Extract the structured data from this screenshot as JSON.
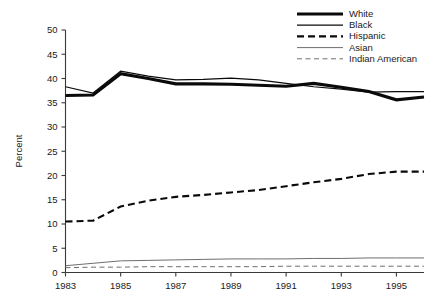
{
  "chart_data": {
    "type": "line",
    "title": "",
    "xlabel": "",
    "ylabel": "Percent",
    "xlim": [
      1983,
      1996
    ],
    "ylim": [
      0,
      50
    ],
    "grid": false,
    "legend_position": "top-right",
    "x": [
      1983,
      1984,
      1985,
      1986,
      1987,
      1988,
      1989,
      1990,
      1991,
      1992,
      1993,
      1994,
      1995,
      1996
    ],
    "y_ticks": [
      0,
      5,
      10,
      15,
      20,
      25,
      30,
      35,
      40,
      45,
      50
    ],
    "y_tick_labels": [
      "0",
      "5",
      "10",
      "15",
      "20",
      "25",
      "30",
      "35",
      "40",
      "45",
      "50"
    ],
    "x_ticks": [
      1983,
      1985,
      1987,
      1989,
      1991,
      1993,
      1995
    ],
    "x_tick_labels": [
      "1983",
      "1985",
      "1987",
      "1989",
      "1991",
      "1993",
      "1995"
    ],
    "series": [
      {
        "name": "White",
        "style": "solid",
        "width": 3.1,
        "color": "#0a0a0a",
        "values": [
          36.5,
          36.6,
          41.0,
          40.0,
          38.9,
          38.9,
          38.8,
          38.6,
          38.4,
          39.0,
          38.2,
          37.3,
          35.6,
          36.2
        ]
      },
      {
        "name": "Black",
        "style": "solid",
        "width": 1.25,
        "color": "#0a0a0a",
        "values": [
          38.3,
          37.0,
          41.5,
          40.5,
          39.7,
          39.8,
          40.1,
          39.7,
          39.0,
          38.3,
          37.8,
          37.2,
          37.3,
          37.3
        ]
      },
      {
        "name": "Hispanic",
        "style": "dashed",
        "width": 2.1,
        "color": "#0a0a0a",
        "values": [
          10.5,
          10.7,
          13.6,
          14.8,
          15.6,
          16.0,
          16.5,
          17.0,
          17.8,
          18.6,
          19.3,
          20.3,
          20.8,
          20.8
        ]
      },
      {
        "name": "Asian",
        "style": "solid",
        "width": 1.0,
        "color": "#6e6e6e",
        "values": [
          1.4,
          1.9,
          2.4,
          2.5,
          2.6,
          2.7,
          2.8,
          2.8,
          2.8,
          2.9,
          2.9,
          3.0,
          3.0,
          3.0
        ]
      },
      {
        "name": "Indian American",
        "style": "dashed",
        "width": 1.0,
        "color": "#6e6e6e",
        "values": [
          1.0,
          1.1,
          1.1,
          1.2,
          1.2,
          1.2,
          1.2,
          1.2,
          1.3,
          1.3,
          1.3,
          1.3,
          1.3,
          1.3
        ]
      }
    ]
  },
  "axes": {
    "ylabel": "Percent"
  },
  "legend": {
    "entries": [
      {
        "label": "White"
      },
      {
        "label": "Black"
      },
      {
        "label": "Hispanic"
      },
      {
        "label": "Asian"
      },
      {
        "label": "Indian American"
      }
    ]
  }
}
